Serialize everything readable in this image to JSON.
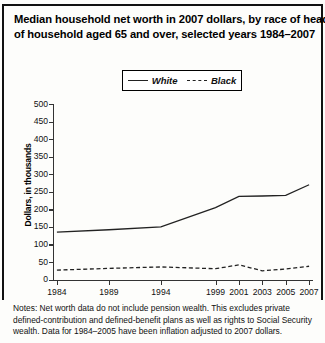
{
  "title": {
    "line1": "Median household net worth in 2007 dollars, by race of head",
    "line2": "of household aged 65 and over, selected years 1984–2007"
  },
  "legend": {
    "white_label": "White",
    "black_label": "Black",
    "position": "top-center"
  },
  "notes": "Notes: Net worth data do not include pension wealth. This excludes private defined-contribution and defined-benefit plans as well as rights to Social Security wealth. Data for 1984–2005 have been inflation adjusted to 2007 dollars.",
  "colors": {
    "line": "#222222",
    "axis": "#333333",
    "text": "#111111",
    "background": "#fdfdfb"
  },
  "chart_data": {
    "type": "line",
    "title": "Median household net worth in 2007 dollars, by race of head of household aged 65 and over, selected years 1984–2007",
    "xlabel": "",
    "ylabel": "Dollars, in thousands",
    "x": [
      1984,
      1989,
      1994,
      1999,
      2001,
      2003,
      2005,
      2007
    ],
    "categories": [
      "1984",
      "1989",
      "1994",
      "1999",
      "2001",
      "2003",
      "2005",
      "2007"
    ],
    "xtick_labels": [
      "1984",
      "1989",
      "1994",
      "1999",
      "2001",
      "2003",
      "2005",
      "2007"
    ],
    "ytick_labels": [
      "0",
      "50",
      "100",
      "150",
      "200",
      "250",
      "300",
      "350",
      "400",
      "450",
      "500"
    ],
    "ylim": [
      0,
      500
    ],
    "ytick_step": 50,
    "grid": false,
    "legend_position": "top-center",
    "series": [
      {
        "name": "White",
        "style": "solid",
        "values": [
          135,
          142,
          150,
          205,
          237,
          238,
          240,
          270
        ]
      },
      {
        "name": "Black",
        "style": "dashed",
        "values": [
          27,
          32,
          36,
          31,
          42,
          25,
          30,
          38
        ]
      }
    ]
  }
}
